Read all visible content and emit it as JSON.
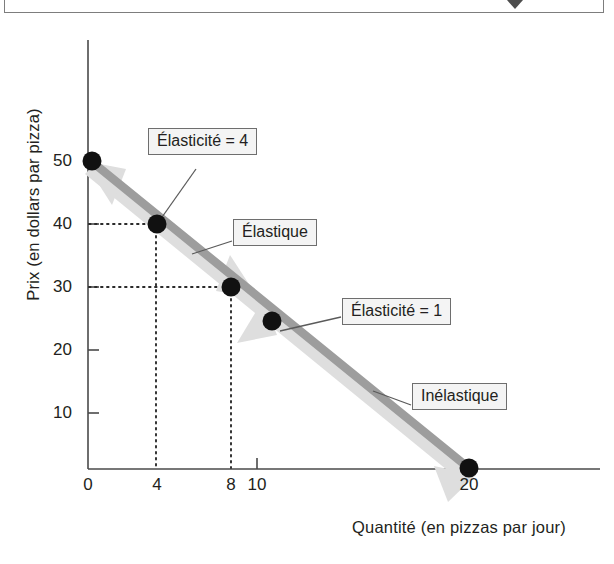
{
  "top_bar": {
    "chevron_icon": "chevron-down-icon",
    "chevron_x": 510
  },
  "chart_data": {
    "type": "line",
    "title": "",
    "xlabel": "Quantité (en pizzas par jour)",
    "ylabel": "Prix (en dollars par pizza)",
    "xlim": [
      0,
      23
    ],
    "ylim": [
      0,
      56
    ],
    "grid": false,
    "legend": "none",
    "x_ticks": [
      {
        "value": 0,
        "label": "0"
      },
      {
        "value": 4,
        "label": "4"
      },
      {
        "value": 8,
        "label": "8"
      },
      {
        "value": 10,
        "label": "10"
      },
      {
        "value": 20,
        "label": "20"
      }
    ],
    "y_ticks": [
      {
        "value": 10,
        "label": "10"
      },
      {
        "value": 20,
        "label": "20"
      },
      {
        "value": 30,
        "label": "30"
      },
      {
        "value": 40,
        "label": "40"
      },
      {
        "value": 50,
        "label": "50"
      }
    ],
    "series": [
      {
        "name": "Demande",
        "color": "#9d9d9d",
        "x": [
          0,
          20
        ],
        "y": [
          50,
          0
        ],
        "points": [
          {
            "x": 0,
            "y": 50
          },
          {
            "x": 4,
            "y": 40
          },
          {
            "x": 8,
            "y": 30
          },
          {
            "x": 10,
            "y": 25
          },
          {
            "x": 20,
            "y": 0
          }
        ]
      }
    ],
    "guide_lines": [
      {
        "from_point": {
          "x": 4,
          "y": 40
        },
        "style": "dotted",
        "to_axes": [
          "x",
          "y"
        ]
      },
      {
        "from_point": {
          "x": 8,
          "y": 30
        },
        "style": "dotted",
        "to_axes": [
          "x",
          "y"
        ]
      }
    ],
    "annotations": [
      {
        "id": "elasticite-4",
        "text": "Élasticité = 4",
        "anchor_point": {
          "x": 4,
          "y": 40
        }
      },
      {
        "id": "elastique",
        "text": "Élastique",
        "anchor_point": {
          "x": 6,
          "y": 35
        }
      },
      {
        "id": "elasticite-1",
        "text": "Élasticité = 1",
        "anchor_point": {
          "x": 10,
          "y": 25
        }
      },
      {
        "id": "inelastique",
        "text": "Inélastique",
        "anchor_point": {
          "x": 15,
          "y": 12.5
        }
      }
    ],
    "colors": {
      "curve": "#9d9d9d",
      "arrow_overlay": "#dcdcdc",
      "point": "#111111",
      "axis": "#4a4a4a",
      "text": "#231f20",
      "box_fill": "#f4f4f4",
      "box_border": "#6e6e6e"
    }
  }
}
